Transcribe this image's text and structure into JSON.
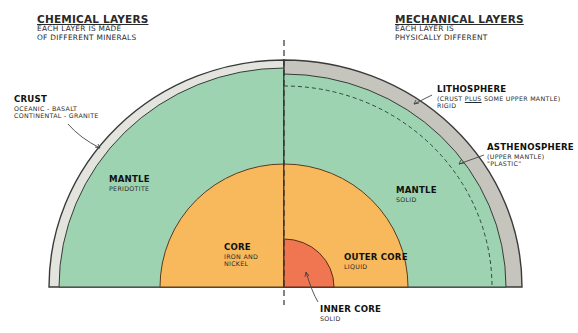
{
  "headers": {
    "chemical": {
      "title": "CHEMICAL LAYERS",
      "line1": "EACH LAYER IS MADE",
      "line2": "OF DIFFERENT MINERALS"
    },
    "mechanical": {
      "title": "MECHANICAL LAYERS",
      "line1": "EACH LAYER IS",
      "line2": "PHYSICALLY DIFFERENT"
    }
  },
  "chemical_layers": {
    "crust": {
      "name": "CRUST",
      "line1": "OCEANIC - BASALT",
      "line2": "CONTINENTAL - GRANITE"
    },
    "mantle": {
      "name": "MANTLE",
      "line1": "PERIDOTITE"
    },
    "core": {
      "name": "CORE",
      "line1": "IRON AND",
      "line2": "NICKEL"
    }
  },
  "mechanical_layers": {
    "lithosphere": {
      "name": "LITHOSPHERE",
      "line1_pre": "(CRUST ",
      "line1_em": "PLUS",
      "line1_post": " SOME UPPER MANTLE)",
      "line2": "RIGID"
    },
    "asthenosphere": {
      "name": "ASTHENOSPHERE",
      "line1": "(UPPER MANTLE)",
      "line2": "\"PLASTIC\""
    },
    "mantle": {
      "name": "MANTLE",
      "line1": "SOLID"
    },
    "outer_core": {
      "name": "OUTER CORE",
      "line1": "LIQUID"
    },
    "inner_core": {
      "name": "INNER CORE",
      "line1": "SOLID"
    }
  },
  "colors": {
    "crust": "#e4e4df",
    "lithosphere": "#c5c4bd",
    "mantle": "#9dd3b1",
    "core": "#f7b95c",
    "inner_core": "#ef7650",
    "outline": "#3a3a3a"
  }
}
